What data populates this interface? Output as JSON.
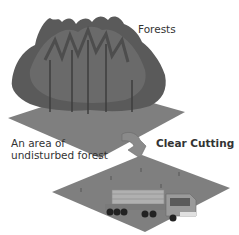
{
  "labels": {
    "forests": "Forests",
    "undisturbed_line1": "An area of",
    "undisturbed_line2": "undisturbed forest",
    "clear_cutting": "Clear Cutting"
  },
  "colors": {
    "ground": "#7f7f7f",
    "ground_dark": "#6a6a6a",
    "tree_dark": "#4d4d4d",
    "tree_mid": "#666666",
    "arrow": "#8a8a8a",
    "truck_body": "#9a9a9a",
    "logs": "#b0b0b0"
  }
}
